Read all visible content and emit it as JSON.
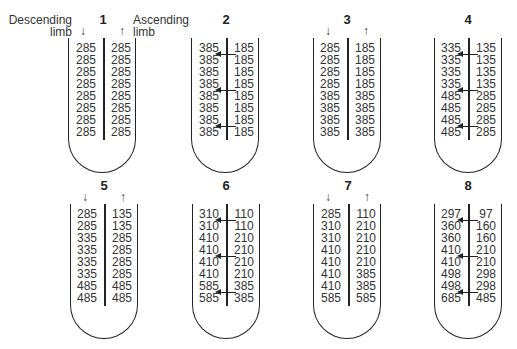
{
  "labels": {
    "descending": [
      "Descending",
      "limb"
    ],
    "ascending": [
      "Ascending",
      "limb"
    ],
    "down_arrow": "↓",
    "up_arrow": "↑"
  },
  "panels": [
    {
      "num": "1",
      "x": 68,
      "y": 38,
      "show_dir": true,
      "divider": 35,
      "descending": [
        "285",
        "285",
        "285",
        "285",
        "285",
        "285",
        "285",
        "285"
      ],
      "ascending": [
        "285",
        "285",
        "285",
        "285",
        "285",
        "285",
        "285",
        "285"
      ],
      "flow_arrows": []
    },
    {
      "num": "2",
      "x": 191,
      "y": 38,
      "show_dir": false,
      "divider": 35,
      "descending": [
        "385",
        "385",
        "385",
        "385",
        "385",
        "385",
        "385",
        "385"
      ],
      "ascending": [
        "185",
        "185",
        "185",
        "185",
        "185",
        "185",
        "185",
        "185"
      ],
      "flow_arrows": [
        1,
        4,
        7
      ]
    },
    {
      "num": "3",
      "x": 313,
      "y": 38,
      "show_dir": true,
      "divider": 34,
      "descending": [
        "285",
        "285",
        "285",
        "285",
        "385",
        "385",
        "385",
        "385"
      ],
      "ascending": [
        "185",
        "185",
        "185",
        "185",
        "385",
        "385",
        "385",
        "385"
      ],
      "flow_arrows": []
    },
    {
      "num": "4",
      "x": 434,
      "y": 38,
      "show_dir": false,
      "divider": 34,
      "descending": [
        "335",
        "335",
        "335",
        "335",
        "485",
        "485",
        "485",
        "485"
      ],
      "ascending": [
        "135",
        "135",
        "135",
        "135",
        "285",
        "285",
        "285",
        "285"
      ],
      "flow_arrows": [
        1,
        4,
        7
      ]
    },
    {
      "num": "5",
      "x": 70,
      "y": 204,
      "show_dir": true,
      "divider": 34,
      "descending": [
        "285",
        "285",
        "335",
        "335",
        "335",
        "335",
        "485",
        "485"
      ],
      "ascending": [
        "135",
        "135",
        "285",
        "285",
        "285",
        "285",
        "485",
        "485"
      ],
      "flow_arrows": []
    },
    {
      "num": "6",
      "x": 192,
      "y": 204,
      "show_dir": false,
      "divider": 34,
      "descending": [
        "310",
        "310",
        "410",
        "410",
        "410",
        "410",
        "585",
        "585"
      ],
      "ascending": [
        "110",
        "110",
        "210",
        "210",
        "210",
        "210",
        "385",
        "385"
      ],
      "flow_arrows": [
        1,
        4,
        7
      ]
    },
    {
      "num": "7",
      "x": 313,
      "y": 204,
      "show_dir": true,
      "divider": 35,
      "descending": [
        "285",
        "310",
        "310",
        "410",
        "410",
        "410",
        "410",
        "585"
      ],
      "ascending": [
        "110",
        "210",
        "210",
        "210",
        "210",
        "385",
        "385",
        "585"
      ],
      "flow_arrows": []
    },
    {
      "num": "8",
      "x": 434,
      "y": 204,
      "show_dir": false,
      "divider": 34,
      "descending": [
        "297",
        "360",
        "360",
        "410",
        "410",
        "498",
        "498",
        "685"
      ],
      "ascending": [
        "97",
        "160",
        "160",
        "210",
        "210",
        "298",
        "298",
        "485"
      ],
      "flow_arrows": [
        1,
        4,
        7
      ]
    }
  ]
}
